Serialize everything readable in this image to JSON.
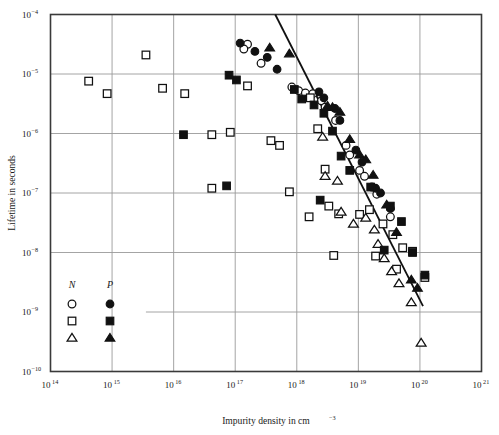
{
  "chart_data": {
    "type": "scatter",
    "title": "",
    "xlabel": "Impurity density in cm",
    "xlabel_sup": "−3",
    "ylabel": "Lifetime in seconds",
    "xlim_log": [
      14,
      21
    ],
    "ylim_log": [
      -10,
      -4
    ],
    "xticks": [
      "10^14",
      "10^15",
      "10^16",
      "10^17",
      "10^18",
      "10^19",
      "10^20",
      "10^21"
    ],
    "xtick_bases": [
      "10",
      "10",
      "10",
      "10",
      "10",
      "10",
      "10",
      "10"
    ],
    "xtick_exps": [
      "14",
      "15",
      "16",
      "17",
      "18",
      "19",
      "20",
      "21"
    ],
    "ytick_bases": [
      "10",
      "10",
      "10",
      "10",
      "10",
      "10",
      "10"
    ],
    "ytick_exps": [
      "−4",
      "−5",
      "−6",
      "−7",
      "−8",
      "−9",
      "−10"
    ],
    "grid": "decade gridlines on both axes",
    "legend_position": "lower-left inside axes",
    "legend": {
      "col_n_label": "N",
      "col_p_label": "P",
      "entries": [
        {
          "n_marker": "circle-open",
          "p_marker": "circle-filled"
        },
        {
          "n_marker": "square-open",
          "p_marker": "square-filled"
        },
        {
          "n_marker": "triangle-open",
          "p_marker": "triangle-filled"
        }
      ]
    },
    "trendline": {
      "x1_log": 17.65,
      "y1_log": -4.0,
      "x2_log": 20.05,
      "y2_log": -8.9
    },
    "series": [
      {
        "name": "N circle-open",
        "marker": "circle-open",
        "points": [
          [
            17.2,
            -4.5
          ],
          [
            17.14,
            -4.58
          ],
          [
            17.42,
            -4.82
          ],
          [
            17.92,
            -5.22
          ],
          [
            18.03,
            -5.28
          ],
          [
            18.14,
            -5.32
          ],
          [
            18.26,
            -5.33
          ],
          [
            18.4,
            -5.45
          ],
          [
            18.46,
            -5.56
          ],
          [
            18.63,
            -5.78
          ],
          [
            18.8,
            -6.2
          ],
          [
            18.86,
            -6.36
          ],
          [
            19.02,
            -6.62
          ],
          [
            19.1,
            -6.72
          ],
          [
            19.22,
            -6.9
          ],
          [
            19.3,
            -7.02
          ],
          [
            19.52,
            -7.4
          ]
        ]
      },
      {
        "name": "N square-open",
        "marker": "square-open",
        "points": [
          [
            15.55,
            -4.68
          ],
          [
            14.62,
            -5.12
          ],
          [
            14.92,
            -5.33
          ],
          [
            15.82,
            -5.24
          ],
          [
            16.18,
            -5.33
          ],
          [
            17.2,
            -5.2
          ],
          [
            16.62,
            -6.02
          ],
          [
            16.92,
            -5.98
          ],
          [
            17.58,
            -6.12
          ],
          [
            17.72,
            -6.2
          ],
          [
            16.62,
            -6.92
          ],
          [
            17.88,
            -6.98
          ],
          [
            18.22,
            -5.4
          ],
          [
            18.34,
            -5.92
          ],
          [
            18.46,
            -6.6
          ],
          [
            18.52,
            -7.22
          ],
          [
            18.2,
            -7.4
          ],
          [
            18.68,
            -7.35
          ],
          [
            19.02,
            -7.36
          ],
          [
            19.18,
            -7.28
          ],
          [
            19.4,
            -7.52
          ],
          [
            19.56,
            -7.7
          ],
          [
            19.72,
            -7.92
          ],
          [
            19.88,
            -7.98
          ],
          [
            19.62,
            -8.28
          ],
          [
            20.08,
            -8.42
          ],
          [
            18.6,
            -8.05
          ],
          [
            19.28,
            -8.06
          ]
        ]
      },
      {
        "name": "N triangle-open",
        "marker": "triangle-open",
        "points": [
          [
            18.42,
            -6.06
          ],
          [
            18.46,
            -6.72
          ],
          [
            18.66,
            -6.8
          ],
          [
            18.72,
            -7.32
          ],
          [
            18.92,
            -7.52
          ],
          [
            19.12,
            -7.42
          ],
          [
            19.26,
            -7.62
          ],
          [
            19.32,
            -7.86
          ],
          [
            19.42,
            -8.1
          ],
          [
            19.54,
            -8.32
          ],
          [
            19.66,
            -8.52
          ],
          [
            19.86,
            -8.84
          ],
          [
            20.02,
            -9.52
          ]
        ]
      },
      {
        "name": "P circle-filled",
        "marker": "circle-filled",
        "points": [
          [
            17.08,
            -4.48
          ],
          [
            17.32,
            -4.62
          ],
          [
            17.52,
            -4.72
          ],
          [
            17.68,
            -4.92
          ],
          [
            18.36,
            -5.3
          ],
          [
            18.44,
            -5.4
          ],
          [
            18.62,
            -5.58
          ],
          [
            18.7,
            -5.78
          ],
          [
            18.96,
            -6.28
          ],
          [
            19.06,
            -6.48
          ],
          [
            19.28,
            -6.92
          ],
          [
            19.36,
            -7.0
          ],
          [
            19.52,
            -7.26
          ]
        ]
      },
      {
        "name": "P square-filled",
        "marker": "square-filled",
        "points": [
          [
            16.9,
            -5.02
          ],
          [
            17.02,
            -5.1
          ],
          [
            16.16,
            -6.02
          ],
          [
            16.86,
            -6.88
          ],
          [
            17.96,
            -5.26
          ],
          [
            18.08,
            -5.42
          ],
          [
            18.28,
            -5.52
          ],
          [
            18.44,
            -5.66
          ],
          [
            18.58,
            -5.96
          ],
          [
            18.72,
            -6.38
          ],
          [
            18.86,
            -6.62
          ],
          [
            18.38,
            -7.12
          ],
          [
            19.2,
            -6.9
          ],
          [
            19.52,
            -7.22
          ],
          [
            19.7,
            -7.48
          ],
          [
            19.88,
            -8.0
          ],
          [
            20.08,
            -8.38
          ],
          [
            19.42,
            -7.96
          ]
        ]
      },
      {
        "name": "P triangle-filled",
        "marker": "triangle-filled",
        "points": [
          [
            17.56,
            -4.56
          ],
          [
            17.88,
            -4.66
          ],
          [
            18.5,
            -5.54
          ],
          [
            18.58,
            -5.56
          ],
          [
            18.7,
            -5.64
          ],
          [
            18.86,
            -6.1
          ],
          [
            19.02,
            -6.36
          ],
          [
            19.12,
            -6.44
          ],
          [
            19.24,
            -6.7
          ],
          [
            19.46,
            -7.2
          ],
          [
            19.62,
            -7.66
          ],
          [
            19.86,
            -8.46
          ],
          [
            19.96,
            -8.6
          ]
        ]
      }
    ]
  }
}
